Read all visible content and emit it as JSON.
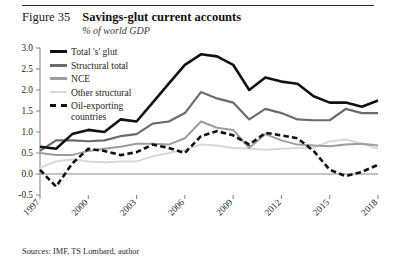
{
  "header": {
    "figure_number": "Figure 35",
    "title": "Savings-glut current accounts",
    "subtitle": "% of world GDP"
  },
  "source_note": "Sources: IMF, TS Lombard, author",
  "colors": {
    "total": "#111111",
    "structural": "#6b6b6b",
    "nce": "#9d9d9d",
    "other": "#d8d8d8",
    "oil": "#111111",
    "axis": "#8a8a8a",
    "zero_line": "#8a8a8a"
  },
  "legend": {
    "items": [
      {
        "label": "Total 's' glut",
        "key": "total",
        "style": "solid-thick"
      },
      {
        "label": "Structural total",
        "key": "structural",
        "style": "solid-thick"
      },
      {
        "label": "NCE",
        "key": "nce",
        "style": "solid"
      },
      {
        "label": "Other structural",
        "key": "other",
        "style": "solid"
      },
      {
        "label": "Oil-exporting\ncountries",
        "key": "oil",
        "style": "dashed"
      }
    ]
  },
  "chart_data": {
    "type": "line",
    "title": "Savings-glut current accounts",
    "subtitle": "% of world GDP",
    "xlabel": "",
    "ylabel": "% of world GDP",
    "ylim": [
      -0.5,
      3.0
    ],
    "ytick_values": [
      -0.5,
      0.0,
      0.5,
      1.0,
      1.5,
      2.0,
      2.5,
      3.0
    ],
    "ytick_labels": [
      "-0.5",
      "0.0",
      "0.5",
      "1.0",
      "1.5",
      "2.0",
      "2.5",
      "3.0"
    ],
    "xlim": [
      1997,
      2018
    ],
    "xtick_values": [
      1997,
      2000,
      2003,
      2006,
      2009,
      2012,
      2015,
      2018
    ],
    "xtick_labels": [
      "1997",
      "2000",
      "2003",
      "2006",
      "2009",
      "2012",
      "2015",
      "2018"
    ],
    "x": [
      1997,
      1998,
      1999,
      2000,
      2001,
      2002,
      2003,
      2004,
      2005,
      2006,
      2007,
      2008,
      2009,
      2010,
      2011,
      2012,
      2013,
      2014,
      2015,
      2016,
      2017,
      2018
    ],
    "grid": false,
    "legend_position": "upper-left",
    "zero_line": true,
    "series": [
      {
        "name": "Total 's' glut",
        "key": "total",
        "color": "#111111",
        "style": "solid",
        "width": 2.6,
        "values": [
          0.65,
          0.6,
          0.95,
          1.05,
          1.0,
          1.3,
          1.25,
          1.7,
          2.15,
          2.6,
          2.85,
          2.8,
          2.6,
          2.0,
          2.3,
          2.2,
          2.15,
          1.85,
          1.7,
          1.7,
          1.6,
          1.75
        ]
      },
      {
        "name": "Structural total",
        "key": "structural",
        "color": "#6b6b6b",
        "style": "solid",
        "width": 2.2,
        "values": [
          0.55,
          0.8,
          0.8,
          0.78,
          0.8,
          0.9,
          0.95,
          1.2,
          1.25,
          1.45,
          1.95,
          1.8,
          1.7,
          1.3,
          1.55,
          1.45,
          1.3,
          1.28,
          1.28,
          1.55,
          1.45,
          1.45
        ]
      },
      {
        "name": "NCE",
        "key": "nce",
        "color": "#9d9d9d",
        "style": "solid",
        "width": 2.0,
        "values": [
          0.5,
          0.45,
          0.45,
          0.55,
          0.6,
          0.65,
          0.72,
          0.72,
          0.7,
          0.85,
          1.25,
          1.1,
          1.05,
          0.62,
          0.95,
          0.8,
          0.7,
          0.68,
          0.66,
          0.7,
          0.72,
          0.68
        ]
      },
      {
        "name": "Other structural",
        "key": "other",
        "color": "#d8d8d8",
        "style": "solid",
        "width": 2.0,
        "values": [
          0.15,
          0.3,
          0.35,
          0.3,
          0.28,
          0.3,
          0.3,
          0.42,
          0.5,
          0.58,
          0.7,
          0.68,
          0.62,
          0.6,
          0.58,
          0.6,
          0.62,
          0.62,
          0.78,
          0.82,
          0.72,
          0.6
        ]
      },
      {
        "name": "Oil-exporting countries",
        "key": "oil",
        "color": "#111111",
        "style": "dashed",
        "width": 2.6,
        "values": [
          0.1,
          -0.3,
          0.25,
          0.6,
          0.55,
          0.45,
          0.52,
          0.7,
          0.62,
          0.5,
          0.9,
          1.02,
          0.92,
          0.7,
          0.98,
          0.92,
          0.85,
          0.55,
          0.1,
          -0.05,
          0.05,
          0.22
        ]
      }
    ]
  }
}
